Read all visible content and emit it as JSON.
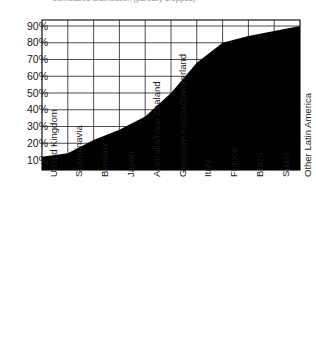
{
  "title": {
    "clipped_fragment": "Cumulative Distribution (partially cropped)",
    "visible": false
  },
  "chart_data": {
    "type": "area",
    "title": "",
    "xlabel": "",
    "ylabel": "",
    "grid": true,
    "legend": null,
    "ylim": [
      0,
      95
    ],
    "ytick_labels": [
      "90%",
      "80%",
      "70%",
      "60%",
      "50%",
      "40%",
      "30%",
      "20%",
      "10%"
    ],
    "ytick_values": [
      90,
      80,
      70,
      60,
      50,
      40,
      30,
      20,
      10
    ],
    "categories": [
      "United Kingdom",
      "Scandinavia",
      "Benelux",
      "Japan",
      "Australia/New Zealand",
      "Germany/Austria/Switzerland",
      "Italy",
      "France",
      "Brazil",
      "Spain",
      "Other Latin America"
    ],
    "values": [
      12,
      14,
      22,
      28,
      36,
      50,
      68,
      80,
      84,
      87,
      90
    ],
    "series": [
      {
        "name": "Cumulative share",
        "values": [
          12,
          14,
          22,
          28,
          36,
          50,
          68,
          80,
          84,
          87,
          90
        ]
      }
    ],
    "fill_color": "#000000",
    "grid_color": "#000000",
    "axis_color": "#000000"
  }
}
